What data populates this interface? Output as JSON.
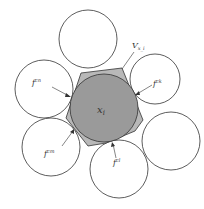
{
  "diagram": {
    "center_label": "x",
    "center_subscript": "i",
    "cell_label": "V",
    "cell_subscript": "x_i",
    "contact_labels": [
      {
        "base": "f",
        "sup": "cn"
      },
      {
        "base": "f",
        "sup": "ck"
      },
      {
        "base": "f",
        "sup": "cm"
      },
      {
        "base": "f",
        "sup": "cl"
      }
    ],
    "colors": {
      "hexagon_fill": "#b8b8b8",
      "center_circle_fill": "#9a9a9a",
      "outline": "#333333"
    }
  }
}
